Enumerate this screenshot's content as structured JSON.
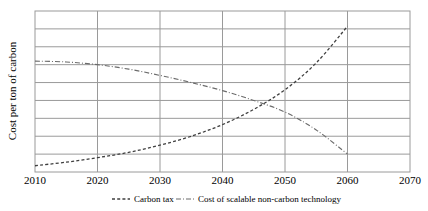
{
  "chart_data": {
    "type": "line",
    "title": "",
    "xlabel": "",
    "ylabel": "Cost per ton of carbon",
    "xlim": [
      2010,
      2070
    ],
    "ylim": [
      0,
      9
    ],
    "xticks": [
      "2010",
      "2020",
      "2030",
      "2040",
      "2050",
      "2060",
      "2070"
    ],
    "yticks": [],
    "grid": "horizontal-and-vertical",
    "legend_position": "bottom-center",
    "series": [
      {
        "name": "Carbon tax",
        "style": "dashed",
        "color": "#3f3f3f",
        "x": [
          2010,
          2015,
          2020,
          2025,
          2030,
          2035,
          2040,
          2045,
          2050,
          2055,
          2060
        ],
        "values": [
          0.35,
          0.55,
          0.8,
          1.1,
          1.5,
          2.0,
          2.65,
          3.5,
          4.6,
          6.1,
          8.15
        ]
      },
      {
        "name": "Cost of scalable non-carbon technology",
        "style": "dash-dot",
        "color": "#6b6b6b",
        "x": [
          2010,
          2015,
          2020,
          2025,
          2030,
          2035,
          2040,
          2045,
          2050,
          2055,
          2060
        ],
        "values": [
          6.2,
          6.15,
          6.0,
          5.75,
          5.4,
          5.0,
          4.55,
          4.0,
          3.35,
          2.35,
          1.0
        ]
      }
    ]
  },
  "axis": {
    "y_title": "Cost per ton of carbon",
    "x_tick_labels": [
      "2010",
      "2020",
      "2030",
      "2040",
      "2050",
      "2060",
      "2070"
    ]
  },
  "legend": {
    "items": [
      {
        "label": "Carbon tax",
        "marker": "dashed-line-marker"
      },
      {
        "label": "Cost of scalable non-carbon technology",
        "marker": "dash-dot-line-marker"
      }
    ]
  },
  "colors": {
    "plot_border": "#9a9a9a",
    "gridline": "#9a9a9a",
    "carbon_tax": "#3f3f3f",
    "tech_cost": "#6b6b6b",
    "background": "#ffffff"
  }
}
